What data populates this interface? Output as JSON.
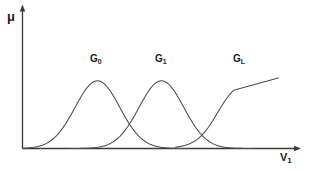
{
  "figure": {
    "axes": {
      "y_label": "μ",
      "x_label_base": "V",
      "x_label_sub": "1",
      "stroke_color": "#3a3a3a"
    },
    "labels": [
      {
        "base": "G",
        "sub": "0"
      },
      {
        "base": "G",
        "sub": "1"
      },
      {
        "base": "G",
        "sub": "L"
      }
    ]
  },
  "chart_data": {
    "type": "line",
    "title": "",
    "xlabel": "V1",
    "ylabel": "μ",
    "xlim": [
      0,
      1
    ],
    "ylim": [
      0,
      1.15
    ],
    "grid": false,
    "legend": "none",
    "annotations": [
      {
        "text": "G0",
        "x": 0.275,
        "y": 1.03
      },
      {
        "text": "G1",
        "x": 0.512,
        "y": 1.03
      },
      {
        "text": "GL",
        "x": 0.79,
        "y": 1.03
      },
      {
        "text": "μ",
        "x": 0.0,
        "y": 1.12
      },
      {
        "text": "V1",
        "x": 0.97,
        "y": -0.08
      }
    ],
    "series": [
      {
        "name": "G0",
        "shape": "gaussian",
        "center": 0.274,
        "sigma": 0.082,
        "amplitude": 0.96,
        "baseline": 0.0
      },
      {
        "name": "G1",
        "shape": "gaussian",
        "center": 0.508,
        "sigma": 0.082,
        "amplitude": 0.96,
        "baseline": 0.0
      },
      {
        "name": "GL",
        "shape": "sigmoid",
        "center": 0.712,
        "slope": 26.0,
        "amplitude": 1.0,
        "plateau_start": 0.772,
        "plateau_end": 0.935,
        "baseline": 0.0
      }
    ]
  }
}
